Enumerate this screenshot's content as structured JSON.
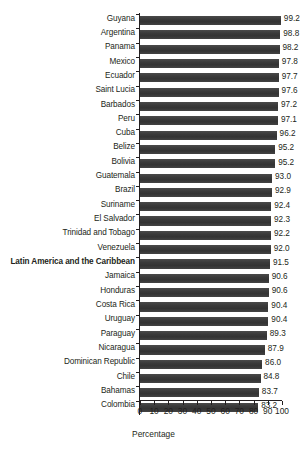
{
  "chart_data": {
    "type": "bar",
    "orientation": "horizontal",
    "title": "",
    "subtitle": "",
    "xlabel": "Percentage",
    "ylabel": "",
    "xlim": [
      0,
      100
    ],
    "xticks": [
      0,
      10,
      20,
      30,
      40,
      50,
      60,
      70,
      80,
      90,
      100
    ],
    "xtick_labels": [
      "0",
      "10",
      "20",
      "30",
      "40",
      "50",
      "60",
      "70",
      "80",
      "90",
      "100"
    ],
    "grid": false,
    "legend": null,
    "bar_color": "#3f3f3f",
    "text_color": "#231f20",
    "value_label_format": "one-decimal",
    "highlighted_category": "Latin America and the Caribbean",
    "categories": [
      "Guyana",
      "Argentina",
      "Panama",
      "Mexico",
      "Ecuador",
      "Saint Lucia",
      "Barbados",
      "Peru",
      "Cuba",
      "Belize",
      "Bolivia",
      "Guatemala",
      "Brazil",
      "Suriname",
      "El Salvador",
      "Trinidad and Tobago",
      "Venezuela",
      "Latin America and the Caribbean",
      "Jamaica",
      "Honduras",
      "Costa Rica",
      "Uruguay",
      "Paraguay",
      "Nicaragua",
      "Dominican Republic",
      "Chile",
      "Bahamas",
      "Colombia"
    ],
    "values": [
      99.2,
      98.8,
      98.2,
      97.8,
      97.7,
      97.6,
      97.2,
      97.1,
      96.2,
      95.2,
      95.2,
      93.0,
      92.9,
      92.4,
      92.3,
      92.2,
      92.0,
      91.5,
      90.6,
      90.6,
      90.4,
      90.4,
      89.3,
      87.9,
      86.0,
      84.8,
      83.7,
      83.2
    ],
    "value_labels": [
      "99.2",
      "98.8",
      "98.2",
      "97.8",
      "97.7",
      "97.6",
      "97.2",
      "97.1",
      "96.2",
      "95.2",
      "95.2",
      "93.0",
      "92.9",
      "92.4",
      "92.3",
      "92.2",
      "92.0",
      "91.5",
      "90.6",
      "90.6",
      "90.4",
      "90.4",
      "89.3",
      "87.9",
      "86.0",
      "84.8",
      "83.7",
      "83.2"
    ]
  }
}
